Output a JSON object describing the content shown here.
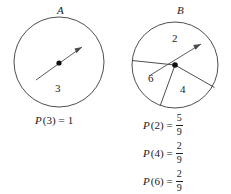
{
  "figure": {
    "spinner_a": {
      "name": "A",
      "sector_labels": [
        "3"
      ],
      "center": [
        59,
        62
      ],
      "radius": 45,
      "needle_angle_deg": 330,
      "needle_length": 38
    },
    "spinner_b": {
      "name": "B",
      "sector_labels": [
        "2",
        "6",
        "4"
      ],
      "center": [
        175,
        65
      ],
      "radius": 43,
      "needle_angle_deg": 332,
      "needle_length": 30,
      "divider_angles_deg": [
        186,
        250,
        297
      ]
    }
  },
  "equations_left": [
    {
      "function": "P",
      "argument": "(3)",
      "equals": "=",
      "value_type": "whole",
      "value": "1"
    }
  ],
  "equations_right": [
    {
      "function": "P",
      "argument": "(2)",
      "equals": "=",
      "value_type": "fraction",
      "numerator": "5",
      "denominator": "9"
    },
    {
      "function": "P",
      "argument": "(4)",
      "equals": "=",
      "value_type": "fraction",
      "numerator": "2",
      "denominator": "9"
    },
    {
      "function": "P",
      "argument": "(6)",
      "equals": "=",
      "value_type": "fraction",
      "numerator": "2",
      "denominator": "9"
    }
  ],
  "colors": {
    "stroke": "#3a3a3a",
    "hub": "#111111",
    "text": "#222222",
    "background": "#ffffff"
  }
}
